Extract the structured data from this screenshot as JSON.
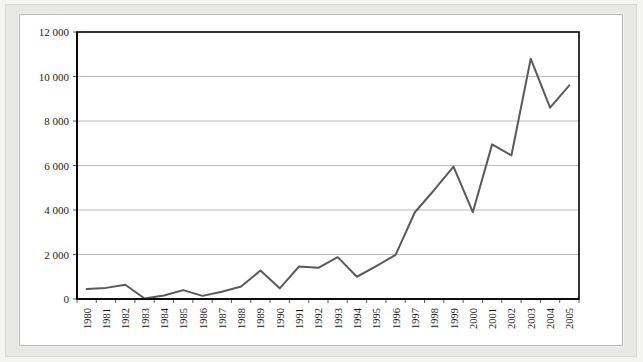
{
  "chart_data": {
    "type": "line",
    "title": "",
    "subtitle": "",
    "xlabel": "",
    "ylabel": "",
    "ylim": [
      0,
      12000
    ],
    "ytick_values": [
      0,
      2000,
      4000,
      6000,
      8000,
      10000,
      12000
    ],
    "ytick_labels": [
      "0",
      "2 000",
      "4 000",
      "6 000",
      "8 000",
      "10 000",
      "12 000"
    ],
    "grid": true,
    "grid_axis": "y",
    "legend": false,
    "legend_position": "none",
    "x_tick_rotation": 90,
    "categories": [
      "1980",
      "1981",
      "1982",
      "1983",
      "1984",
      "1985",
      "1986",
      "1987",
      "1988",
      "1989",
      "1990",
      "1991",
      "1992",
      "1993",
      "1994",
      "1995",
      "1996",
      "1997",
      "1998",
      "1999",
      "2000",
      "2001",
      "2002",
      "2003",
      "2004",
      "2005"
    ],
    "series": [
      {
        "name": "",
        "color": "#5a5a5a",
        "values": [
          450,
          500,
          640,
          20,
          160,
          400,
          140,
          330,
          560,
          1280,
          480,
          1460,
          1400,
          1880,
          1000,
          1480,
          1980,
          3900,
          4900,
          5950,
          3900,
          6950,
          6450,
          10800,
          8600,
          9600
        ]
      }
    ]
  },
  "style": {
    "line_color": "#5a5a5a",
    "grid_color": "#a8a8a8",
    "axis_color": "#000000",
    "plot_background": "#ffffff",
    "page_background": "#f4f4f2",
    "frame_color": "#e8e8e6",
    "text_color": "#1a1a1a"
  }
}
